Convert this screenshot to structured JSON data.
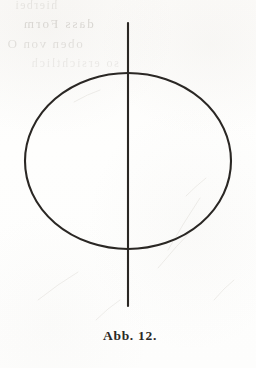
{
  "figure": {
    "caption": "Abb. 12.",
    "caption_label": "Abb.",
    "figure_number": "12.",
    "kind": "geometric-diagram",
    "shapes": [
      {
        "name": "ellipse",
        "type": "ellipse",
        "cx": 128,
        "cy": 161,
        "rx": 103,
        "ry": 88,
        "stroke": "#2a2724",
        "stroke_width": 2.0,
        "fill": "none"
      },
      {
        "name": "vertical-axis-line",
        "type": "line",
        "x1": 128,
        "y1": 23,
        "x2": 128,
        "y2": 306,
        "stroke": "#2a2724",
        "stroke_width": 2.0
      }
    ]
  },
  "page": {
    "background_color": "#fdfdfc",
    "ink_color": "#2a2724",
    "bleed_color": "#9f9a92",
    "width": 256,
    "height": 368
  },
  "showthrough": {
    "note": "faint mirrored text bleeding through from the reverse of the page; largely illegible",
    "lines": [
      "hierbei",
      "dass Form",
      "oben von O",
      "so ersichtlich"
    ]
  }
}
